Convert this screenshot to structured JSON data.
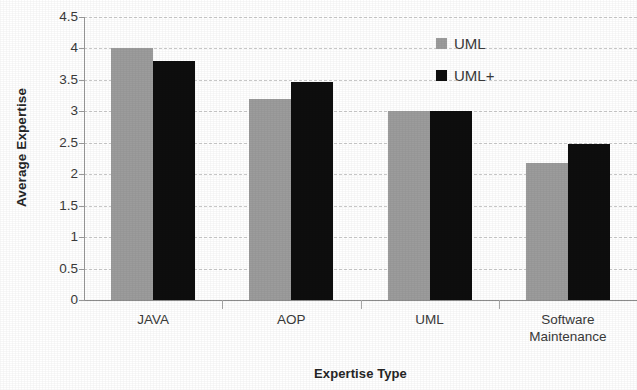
{
  "chart_data": {
    "type": "bar",
    "title": "",
    "xlabel": "Expertise Type",
    "ylabel": "Average Expertise",
    "categories": [
      "JAVA",
      "AOP",
      "UML",
      "Software\nMaintenance"
    ],
    "series": [
      {
        "name": "UML",
        "color": "#9c9c9c",
        "values": [
          4.0,
          3.2,
          3.0,
          2.18
        ]
      },
      {
        "name": "UML+",
        "color": "#0e0e0e",
        "values": [
          3.8,
          3.47,
          3.0,
          2.48
        ]
      }
    ],
    "ylim": [
      0,
      4.5
    ],
    "ytick_labels": [
      "4.5",
      "4",
      "3.5",
      "3",
      "2.5",
      "2",
      "1.5",
      "1",
      "0.5",
      "0"
    ],
    "ytick_values": [
      4.5,
      4,
      3.5,
      3,
      2.5,
      2,
      1.5,
      1,
      0.5,
      0
    ],
    "grid": true,
    "grid_style": "dashed-horizontal",
    "legend_position": "top-right",
    "legend_entries": [
      "UML",
      "UML+"
    ],
    "bar_grouping": "grouped-adjacent"
  },
  "axis": {
    "y_title": "Average Expertise",
    "x_title": "Expertise Type"
  },
  "legend": {
    "items": [
      {
        "label": "UML",
        "swatch": "legend-swatch-uml"
      },
      {
        "label": "UML+",
        "swatch": "legend-swatch-umlplus"
      }
    ]
  },
  "colors": {
    "series_uml": "#9c9c9c",
    "series_umlplus": "#0e0e0e",
    "gridline": "#c9c9c9",
    "axis": "#9a9a9a",
    "text": "#3a3a3a",
    "background": "#ffffff"
  }
}
